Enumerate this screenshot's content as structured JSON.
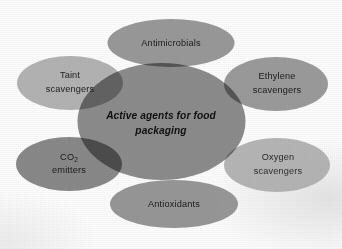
{
  "figure": {
    "type": "venn-cluster-diagram",
    "center": {
      "label_line1": "Active agents for food",
      "label_line2": "packaging",
      "full_label": "Active agents for food packaging",
      "color": "#8d8d8d"
    },
    "nodes": [
      {
        "id": "antimicrobials",
        "label_line1": "Antimicrobials",
        "label_line2": "",
        "position": "top",
        "color": "#9a9a9a"
      },
      {
        "id": "taint-scavengers",
        "label_line1": "Taint",
        "label_line2": "scavengers",
        "position": "upper-left",
        "color": "#b5b5b5"
      },
      {
        "id": "ethylene-scavengers",
        "label_line1": "Ethylene",
        "label_line2": "scavengers",
        "position": "upper-right",
        "color": "#9c9c9c"
      },
      {
        "id": "co2-emitters",
        "label_prefix": "CO",
        "label_subscript": "2",
        "label_line2": "emitters",
        "position": "lower-left",
        "color": "#8a8a8a"
      },
      {
        "id": "oxygen-scavengers",
        "label_line1": "Oxygen",
        "label_line2": "scavengers",
        "position": "lower-right",
        "color": "#b8b8b8"
      },
      {
        "id": "antioxidants",
        "label_line1": "Antioxidants",
        "label_line2": "",
        "position": "bottom",
        "color": "#989898"
      }
    ],
    "background_color": "#ffffff",
    "text_color": "#1b1b1b"
  }
}
